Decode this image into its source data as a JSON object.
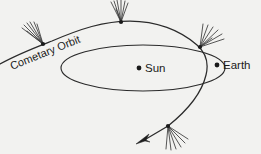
{
  "figure": {
    "kind": "astronomy-diagram",
    "background_color": "#f2f2f0",
    "stroke_color": "#2b2b2b",
    "labels": {
      "cometary_orbit": "Cometary Orbit",
      "sun": "Sun",
      "earth": "Earth"
    },
    "bodies": [
      {
        "name": "sun",
        "label": "Sun",
        "cx": 139,
        "cy": 68,
        "r": 2.4
      },
      {
        "name": "earth",
        "label": "Earth",
        "cx": 217,
        "cy": 65,
        "r": 2.4
      }
    ],
    "comet_positions": [
      {
        "name": "comet-upper-left",
        "cx": 43,
        "cy": 44,
        "tail_direction": "up-left"
      },
      {
        "name": "comet-top",
        "cx": 121,
        "cy": 22,
        "tail_direction": "up"
      },
      {
        "name": "comet-right",
        "cx": 200,
        "cy": 47,
        "tail_direction": "up-right"
      },
      {
        "name": "comet-lower",
        "cx": 168,
        "cy": 126,
        "tail_direction": "down-right"
      }
    ],
    "orbits": [
      {
        "name": "cometary-orbit",
        "type": "open-parabolic-path"
      },
      {
        "name": "earth-orbit",
        "type": "ellipse",
        "cx": 143,
        "cy": 68,
        "rx": 82,
        "ry": 23
      }
    ],
    "direction_arrow": {
      "name": "motion-arrow",
      "tip_x": 137,
      "tip_y": 143,
      "points": "down-left"
    }
  }
}
